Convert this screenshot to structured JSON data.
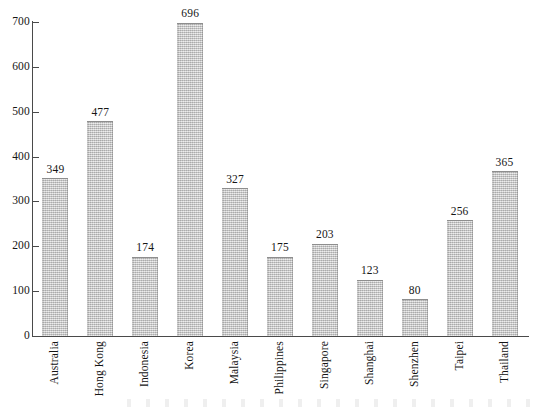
{
  "chart_data": {
    "type": "bar",
    "title": "",
    "subtitle": "",
    "xlabel": "",
    "ylabel": "",
    "ylim": [
      0,
      700
    ],
    "yticks": [
      0,
      100,
      200,
      300,
      400,
      500,
      600,
      700
    ],
    "ytick_labels": [
      "0",
      "100",
      "200",
      "300",
      "400",
      "500",
      "600",
      "700"
    ],
    "grid": false,
    "legend": null,
    "value_labels_shown": true,
    "categories": [
      "Australia",
      "Hong Kong",
      "Indonesia",
      "Korea",
      "Malaysia",
      "Philippines",
      "Singapore",
      "Shanghai",
      "Shenzhen",
      "Taipei",
      "Thailand"
    ],
    "values": [
      349,
      477,
      174,
      696,
      327,
      175,
      203,
      123,
      80,
      256,
      365
    ],
    "bars": [
      {
        "category": "Australia",
        "value": 349,
        "label": "349"
      },
      {
        "category": "Hong Kong",
        "value": 477,
        "label": "477"
      },
      {
        "category": "Indonesia",
        "value": 174,
        "label": "174"
      },
      {
        "category": "Korea",
        "value": 696,
        "label": "696"
      },
      {
        "category": "Malaysia",
        "value": 327,
        "label": "327"
      },
      {
        "category": "Philippines",
        "value": 175,
        "label": "175"
      },
      {
        "category": "Singapore",
        "value": 203,
        "label": "203"
      },
      {
        "category": "Shanghai",
        "value": 123,
        "label": "123"
      },
      {
        "category": "Shenzhen",
        "value": 80,
        "label": "80"
      },
      {
        "category": "Taipei",
        "value": 256,
        "label": "256"
      },
      {
        "category": "Thailand",
        "value": 365,
        "label": "365"
      }
    ],
    "colors": {
      "bar_fill": "#c4c4c4",
      "bar_edge": "#8e8e8e",
      "axis": "#4a4a4a",
      "text": "#161616",
      "background": "#ffffff"
    }
  }
}
